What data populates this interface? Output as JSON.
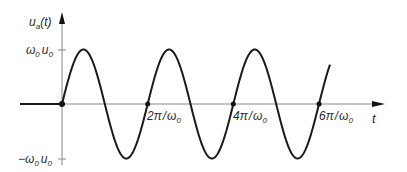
{
  "diagram": {
    "type": "signal-plot",
    "y_axis": {
      "label_main": "u",
      "label_sub": "a",
      "label_arg": "(t)"
    },
    "x_axis": {
      "label": "t"
    },
    "y_ticks": [
      {
        "text_a": "ω",
        "sub_a": "0",
        "text_b": "u",
        "sub_b": "0",
        "value": "ω0 u0"
      },
      {
        "prefix": "−",
        "text_a": "ω",
        "sub_a": "0",
        "text_b": "u",
        "sub_b": "0",
        "value": "−ω0 u0"
      }
    ],
    "x_ticks": [
      {
        "num": "2π",
        "sep": "/",
        "den": "ω",
        "den_sub": "0"
      },
      {
        "num": "4π",
        "sep": "/",
        "den": "ω",
        "den_sub": "0"
      },
      {
        "num": "6π",
        "sep": "/",
        "den": "ω",
        "den_sub": "0"
      }
    ],
    "curve": "u_a(t) = 0 for t < 0; ω0·u0·sin(ω0 t) for t ≥ 0",
    "colors": {
      "curve": "#1a1a1a",
      "axis": "#888888",
      "text": "#2a2a2a"
    }
  }
}
